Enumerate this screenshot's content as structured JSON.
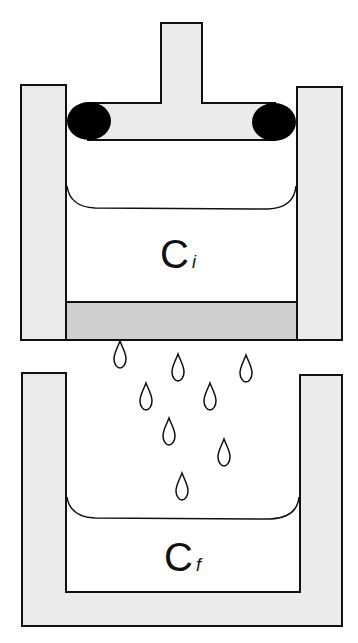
{
  "diagram": {
    "colors": {
      "wall_fill": "#ebebeb",
      "membrane_fill": "#cfcfcf",
      "outline": "#111111",
      "seal": "#000000",
      "background": "#ffffff"
    },
    "upper_chamber": {
      "label_main": "C",
      "label_sub": "i"
    },
    "lower_chamber": {
      "label_main": "C",
      "label_sub": "f"
    },
    "droplet_count": 8
  }
}
